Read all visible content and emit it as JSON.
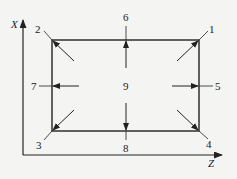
{
  "diagram": {
    "background": "#f4f4f2",
    "stroke_color": "#222222",
    "axes": {
      "vertical_label": "X",
      "horizontal_label": "Z"
    },
    "rectangle": {
      "left": 52,
      "top": 40,
      "right": 199,
      "bottom": 131
    },
    "points": [
      {
        "id": "1",
        "label": "1",
        "position": "top-right corner",
        "arrow": "diagonal inward toward corner"
      },
      {
        "id": "2",
        "label": "2",
        "position": "top-left corner",
        "arrow": "diagonal inward toward corner"
      },
      {
        "id": "3",
        "label": "3",
        "position": "bottom-left corner",
        "arrow": "diagonal inward toward corner"
      },
      {
        "id": "4",
        "label": "4",
        "position": "bottom-right corner",
        "arrow": "diagonal inward toward corner"
      },
      {
        "id": "5",
        "label": "5",
        "position": "right edge midpoint",
        "arrow": "horizontal toward right edge"
      },
      {
        "id": "6",
        "label": "6",
        "position": "top edge midpoint",
        "arrow": "vertical toward top edge"
      },
      {
        "id": "7",
        "label": "7",
        "position": "left edge midpoint",
        "arrow": "horizontal toward left edge"
      },
      {
        "id": "8",
        "label": "8",
        "position": "bottom edge midpoint",
        "arrow": "vertical toward bottom edge"
      },
      {
        "id": "9",
        "label": "9",
        "position": "center",
        "arrow": "none"
      }
    ]
  }
}
